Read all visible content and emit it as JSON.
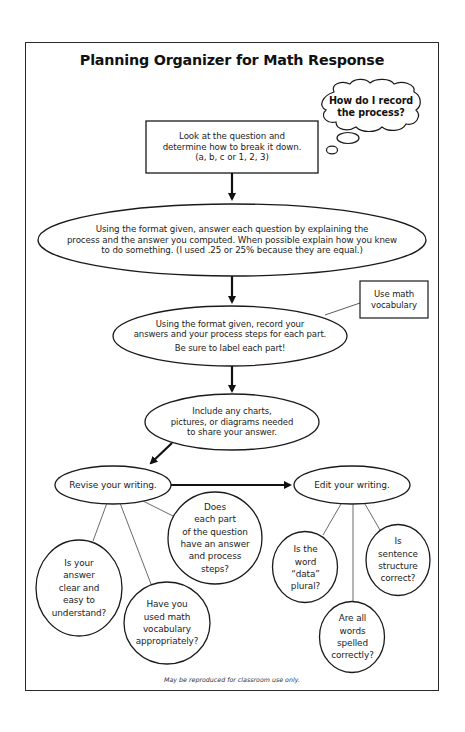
{
  "title": "Planning Organizer for Math Response",
  "thought_bubble": {
    "lines": [
      "How do I record",
      "the process?"
    ]
  },
  "steps": [
    {
      "id": "break-down",
      "shape": "rectangle",
      "lines": [
        "Look at the question and",
        "determine how to break it down.",
        "(a, b, c or 1, 2, 3)"
      ]
    },
    {
      "id": "answer-each",
      "shape": "ellipse",
      "lines": [
        "Using the format given, answer each question by explaining the",
        "process and the answer you computed. When possible explain how you knew",
        "to do something. (I used .25 or 25% because they are equal.)"
      ]
    },
    {
      "id": "record-answers",
      "shape": "ellipse",
      "lines": [
        "Using the format given, record your",
        "answers and your process steps for each part.",
        "Be sure to label each part!"
      ]
    },
    {
      "id": "include-charts",
      "shape": "ellipse",
      "lines": [
        "Include any charts,",
        "pictures, or diagrams needed",
        "to share your answer."
      ]
    },
    {
      "id": "revise",
      "shape": "ellipse",
      "label": "Revise your writing."
    },
    {
      "id": "edit",
      "shape": "ellipse",
      "label": "Edit your writing."
    }
  ],
  "side_note": {
    "lines": [
      "Use math",
      "vocabulary"
    ]
  },
  "revise_questions": [
    {
      "lines": [
        "Is your",
        "answer",
        "clear and",
        "easy to",
        "understand?"
      ]
    },
    {
      "lines": [
        "Have you",
        "used math",
        "vocabulary",
        "appropriately?"
      ]
    },
    {
      "lines": [
        "Does",
        "each part",
        "of the question",
        "have an answer",
        "and process",
        "steps?"
      ]
    }
  ],
  "edit_questions": [
    {
      "lines": [
        "Is the",
        "word",
        "“data”",
        "plural?"
      ]
    },
    {
      "lines": [
        "Are all",
        "words",
        "spelled",
        "correctly?"
      ]
    },
    {
      "lines": [
        "Is",
        "sentence",
        "structure",
        "correct?"
      ]
    }
  ],
  "footer": "May be reproduced for classroom use only.",
  "colors": {
    "stroke": "#1a1a1a",
    "background": "#ffffff"
  }
}
